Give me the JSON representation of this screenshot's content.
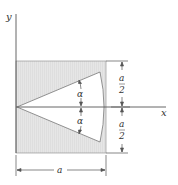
{
  "diagram": {
    "axes": {
      "x_label": "x",
      "y_label": "y"
    },
    "angle_labels": {
      "upper": "α",
      "lower": "α"
    },
    "dimensions": {
      "width_label": "a",
      "upper_half_numerator": "a",
      "upper_half_denominator": "2",
      "lower_half_numerator": "a",
      "lower_half_denominator": "2"
    },
    "colors": {
      "fill": "#e3e3e3",
      "line": "#555555",
      "cutout": "#ffffff"
    }
  }
}
